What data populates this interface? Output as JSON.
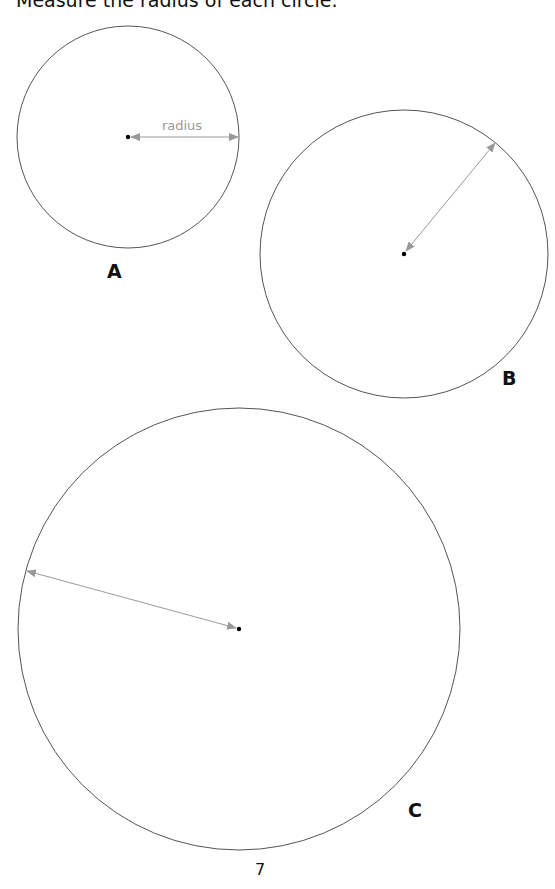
{
  "instruction": "Measure the radius of each circle.",
  "circles": [
    {
      "label": "A",
      "annotation": "radius",
      "has_arrow": true
    },
    {
      "label": "B",
      "annotation": "",
      "has_arrow": true
    },
    {
      "label": "C",
      "annotation": "",
      "has_arrow": true
    }
  ],
  "page_number": "7",
  "colors": {
    "circle_stroke": "#555555",
    "arrow": "#999999",
    "center_dot": "#000000",
    "annotation_text": "#9a9a9a"
  }
}
